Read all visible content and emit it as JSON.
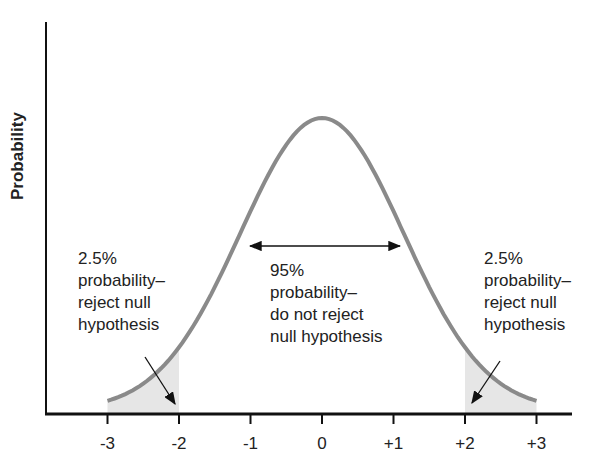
{
  "chart_data": {
    "type": "line",
    "title": "",
    "xlabel": "",
    "ylabel": "Probability",
    "x_ticks": [
      "-3",
      "-2",
      "-1",
      "0",
      "+1",
      "+2",
      "+3"
    ],
    "x_tick_values": [
      -3,
      -2,
      -1,
      0,
      1,
      2,
      3
    ],
    "xlim": [
      -3.5,
      3.8
    ],
    "series": [
      {
        "name": "normal distribution",
        "distribution": "standard normal",
        "mean": 0,
        "sd": 1,
        "x_range": [
          -3,
          3
        ]
      }
    ],
    "shaded_regions": [
      {
        "from": -3,
        "to": -2,
        "label": "2.5% probability–reject null hypothesis"
      },
      {
        "from": 2,
        "to": 3,
        "label": "2.5% probability–reject null hypothesis"
      }
    ],
    "annotations": [
      {
        "text": "2.5% probability– reject null hypothesis",
        "position": "left tail"
      },
      {
        "text": "95% probability– do not reject null hypothesis",
        "position": "center, double arrow between -1 and +1"
      },
      {
        "text": "2.5% probability– reject null hypothesis",
        "position": "right tail"
      }
    ],
    "grid": false,
    "legend": "none"
  },
  "labels": {
    "ylabel": "Probability",
    "left": [
      "2.5%",
      "probability–",
      "reject null",
      "hypothesis"
    ],
    "center": [
      "95%",
      "probability–",
      "do not reject",
      "null hypothesis"
    ],
    "right": [
      "2.5%",
      "probability–",
      "reject null",
      "hypothesis"
    ]
  },
  "colors": {
    "curve": "#8a8a8a",
    "shade": "#e6e6e6",
    "axis": "#111111"
  }
}
